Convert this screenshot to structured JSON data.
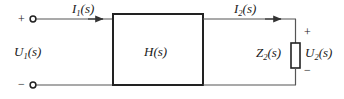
{
  "diagram": {
    "block": {
      "label_main": "H",
      "label_arg": "(s)"
    },
    "input_port": {
      "plus_sign": "+",
      "minus_sign": "−",
      "voltage_symbol": "U",
      "voltage_subscript": "1",
      "voltage_arg": "(s)",
      "current_symbol": "I",
      "current_subscript": "1",
      "current_arg": "(s)"
    },
    "output_port": {
      "plus_sign": "+",
      "minus_sign": "−",
      "voltage_symbol": "U",
      "voltage_subscript": "2",
      "voltage_arg": "(s)",
      "current_symbol": "I",
      "current_subscript": "2",
      "current_arg": "(s)",
      "impedance_symbol": "Z",
      "impedance_subscript": "2",
      "impedance_arg": "(s)"
    },
    "colors": {
      "wire": "#555555",
      "block_stroke": "#222222",
      "text": "#1a1a1a",
      "background": "#ffffff"
    }
  }
}
